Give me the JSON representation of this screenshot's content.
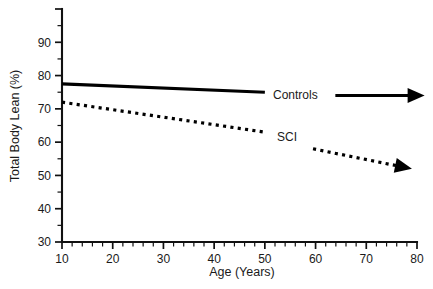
{
  "chart_data": {
    "type": "line",
    "title": "",
    "xlabel": "Age (Years)",
    "ylabel": "Total Body Lean (%)",
    "xlim": [
      10,
      80
    ],
    "ylim": [
      30,
      100
    ],
    "xticks": [
      10,
      20,
      30,
      40,
      50,
      60,
      70,
      80
    ],
    "xtick_labels": [
      "10",
      "20",
      "30",
      "40",
      "50",
      "60",
      "70",
      "80"
    ],
    "yticks": [
      30,
      40,
      50,
      60,
      70,
      80,
      90
    ],
    "ytick_labels": [
      "30",
      "40",
      "50",
      "60",
      "70",
      "80",
      "90"
    ],
    "x_minor_step": 2,
    "y_minor_step": 5,
    "grid": false,
    "legend_position": "inline-annotation",
    "series": [
      {
        "name": "Controls",
        "style": "solid",
        "x": [
          10,
          50
        ],
        "values": [
          77.5,
          75.0
        ]
      },
      {
        "name": "SCI",
        "style": "dotted",
        "x": [
          10,
          50
        ],
        "values": [
          72.0,
          63.0
        ]
      }
    ],
    "annotations": [
      {
        "name": "controls-trend-arrow",
        "label": "Controls",
        "style": "solid",
        "x": [
          63.9,
          81.5
        ],
        "values": [
          74.0,
          74.0
        ]
      },
      {
        "name": "sci-trend-arrow",
        "label": "SCI",
        "style": "dotted",
        "x": [
          59.5,
          79.0
        ],
        "values": [
          58.0,
          52.0
        ]
      }
    ]
  },
  "labels": {
    "series_controls": "Controls",
    "series_sci": "SCI",
    "x_axis_title": "Age (Years)",
    "y_axis_title": "Total Body Lean (%)"
  },
  "colors": {
    "ink": "#111111",
    "background": "#ffffff"
  }
}
